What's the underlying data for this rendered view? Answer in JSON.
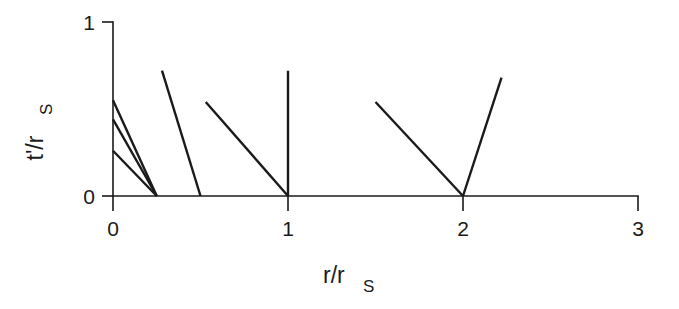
{
  "figure": {
    "background_color": "#ffffff",
    "ink_color": "#1a1a1a"
  },
  "chart_data": {
    "type": "line",
    "title": "",
    "xlabel": "r/r_S",
    "xlabel_main": "r/r",
    "xlabel_sub": "S",
    "ylabel": "t'/r_S",
    "ylabel_main": "t'/r",
    "ylabel_sub": "S",
    "xlim": [
      0,
      3
    ],
    "ylim": [
      0,
      1
    ],
    "xticks": [
      0,
      1,
      2,
      3
    ],
    "xticklabels": [
      "0",
      "1",
      "2",
      "3"
    ],
    "yticks": [
      0,
      1
    ],
    "yticklabels": [
      "0",
      "1"
    ],
    "grid": false,
    "legend": null,
    "series": [
      {
        "name": "infall-trajectory-1",
        "points": [
          [
            0,
            0.55
          ],
          [
            0.25,
            0
          ]
        ]
      },
      {
        "name": "infall-trajectory-2",
        "points": [
          [
            0,
            0.44
          ],
          [
            0.25,
            0
          ]
        ]
      },
      {
        "name": "infall-trajectory-3",
        "points": [
          [
            0,
            0.26
          ],
          [
            0.25,
            0
          ]
        ]
      },
      {
        "name": "infall-trajectory-4",
        "points": [
          [
            0.28,
            0.72
          ],
          [
            0.5,
            0
          ]
        ]
      },
      {
        "name": "infall-trajectory-5",
        "points": [
          [
            0.53,
            0.54
          ],
          [
            1.0,
            0
          ]
        ]
      },
      {
        "name": "vertical-ray-at-1",
        "points": [
          [
            1.0,
            0
          ],
          [
            1.0,
            0.72
          ]
        ]
      },
      {
        "name": "ingoing-ray-to-2",
        "points": [
          [
            1.5,
            0.54
          ],
          [
            2.0,
            0
          ]
        ]
      },
      {
        "name": "outgoing-ray-from-2",
        "points": [
          [
            2.0,
            0
          ],
          [
            2.22,
            0.68
          ]
        ]
      }
    ]
  }
}
